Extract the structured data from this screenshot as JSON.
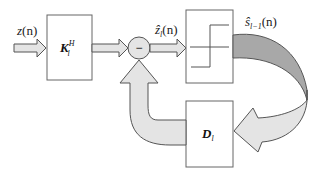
{
  "diagram": {
    "title": "",
    "blocks": [
      {
        "id": "K",
        "label": "K",
        "superscript": "H",
        "subscript": "l"
      },
      {
        "id": "quantizer",
        "label": "",
        "symbol": "step-function"
      },
      {
        "id": "D",
        "label": "D",
        "subscript": "l"
      }
    ],
    "summing_junction": {
      "sign": "−"
    },
    "signals": {
      "input": {
        "base": "z",
        "arg": "(n)"
      },
      "estimate": {
        "base": "ẑ",
        "sub": "l",
        "arg": "(n)"
      },
      "decision": {
        "base": "ŝ",
        "sub": "l−1",
        "arg": "(n)"
      }
    },
    "colors": {
      "arrow_fill": "#e4e4e4",
      "arrow_dark_fill": "#a8a8a8",
      "stroke": "#555555",
      "box_stroke": "#666666"
    }
  }
}
